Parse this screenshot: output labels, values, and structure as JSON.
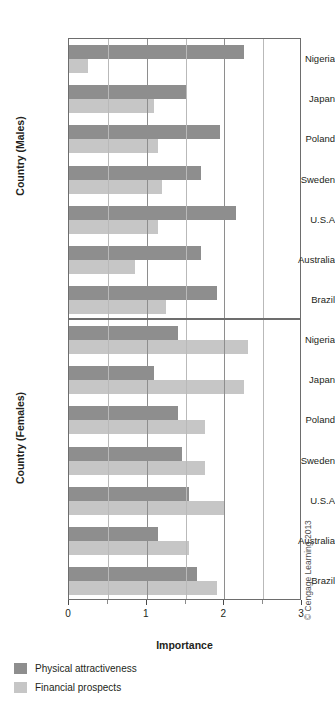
{
  "chart_data": {
    "type": "bar",
    "orientation": "horizontal",
    "title": "",
    "xlabel": "Importance",
    "xlim": [
      0,
      3
    ],
    "xticks": [
      0,
      1,
      2,
      3
    ],
    "xticklabels": [
      "0",
      "1",
      "2",
      "3"
    ],
    "minor_gridlines": [
      0.5,
      1.5,
      2.5
    ],
    "grid": true,
    "legend_position": "below-left",
    "legend": [
      "Physical attractiveness",
      "Financial prospects"
    ],
    "series_colors": {
      "physical_attractiveness": "#8e8e8e",
      "financial_prospects": "#c6c6c6"
    },
    "panels": [
      {
        "ylabel": "Country (Males)",
        "categories": [
          "Nigeria",
          "Japan",
          "Poland",
          "Sweden",
          "U.S.A",
          "Australia",
          "Brazil"
        ],
        "series": [
          {
            "name": "Physical attractiveness",
            "values": [
              2.25,
              1.5,
              1.95,
              1.7,
              2.15,
              1.7,
              1.9
            ]
          },
          {
            "name": "Financial prospects",
            "values": [
              0.25,
              1.1,
              1.15,
              1.2,
              1.15,
              0.85,
              1.25
            ]
          }
        ]
      },
      {
        "ylabel": "Country (Females)",
        "categories": [
          "Nigeria",
          "Japan",
          "Poland",
          "Sweden",
          "U.S.A",
          "Australia",
          "Brazil"
        ],
        "series": [
          {
            "name": "Physical attractiveness",
            "values": [
              1.4,
              1.1,
              1.4,
              1.45,
              1.55,
              1.15,
              1.65
            ]
          },
          {
            "name": "Financial prospects",
            "values": [
              2.3,
              2.25,
              1.75,
              1.75,
              2.0,
              1.55,
              1.9
            ]
          }
        ]
      }
    ]
  },
  "axis": {
    "x_title": "Importance",
    "y_title_males": "Country (Males)",
    "y_title_females": "Country (Females)",
    "tick_0": "0",
    "tick_1": "1",
    "tick_2": "2",
    "tick_3": "3"
  },
  "legend": {
    "item_attractiveness": "Physical attractiveness",
    "item_prospects": "Financial prospects"
  },
  "credit": {
    "text": "© Cengage Learning 2013"
  }
}
